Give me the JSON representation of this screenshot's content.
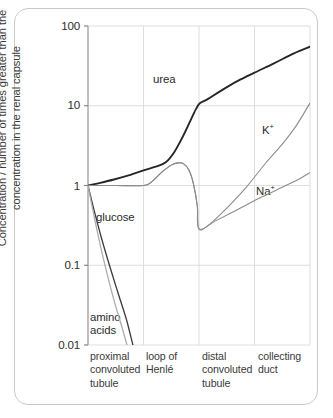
{
  "chart_data": {
    "type": "line",
    "title": "",
    "subtitle": "",
    "xlabel": "",
    "ylabel": "Concentration / number of times greater than the concentration in the renal capsule",
    "ylabel_line1": "Concentration / number of times greater than the",
    "ylabel_line2": "concentration in the renal capsule",
    "yscale": "log",
    "ylim": [
      0.01,
      100
    ],
    "ytick_labels": [
      "100",
      "10",
      "1",
      "0.1",
      "0.01"
    ],
    "ytick_values": [
      100,
      10,
      1,
      0.1,
      0.01
    ],
    "grid": true,
    "grid_axes": "both",
    "legend": "inline-annotations",
    "x_regions": [
      {
        "index": 0,
        "label_lines": [
          "proximal",
          "convoluted",
          "tubule"
        ],
        "x_start": 0,
        "x_end": 1
      },
      {
        "index": 1,
        "label_lines": [
          "loop of",
          "Henlé"
        ],
        "x_start": 1,
        "x_end": 2
      },
      {
        "index": 2,
        "label_lines": [
          "distal",
          "convoluted",
          "tubule"
        ],
        "x_start": 2,
        "x_end": 3
      },
      {
        "index": 3,
        "label_lines": [
          "collecting",
          "duct"
        ],
        "x_start": 3,
        "x_end": 4
      }
    ],
    "xlim": [
      0,
      4
    ],
    "series": [
      {
        "name": "urea",
        "label": "urea",
        "color": "#262626",
        "width": 1.9,
        "points": [
          [
            0.0,
            1.0
          ],
          [
            0.22,
            1.08
          ],
          [
            0.45,
            1.18
          ],
          [
            0.7,
            1.32
          ],
          [
            1.0,
            1.55
          ],
          [
            1.22,
            1.72
          ],
          [
            1.4,
            1.95
          ],
          [
            1.55,
            2.6
          ],
          [
            1.7,
            4.0
          ],
          [
            1.85,
            6.6
          ],
          [
            1.95,
            9.2
          ],
          [
            2.02,
            10.8
          ],
          [
            2.15,
            12.0
          ],
          [
            2.4,
            15.5
          ],
          [
            2.7,
            20.5
          ],
          [
            3.0,
            26.0
          ],
          [
            3.35,
            34.0
          ],
          [
            3.7,
            45.0
          ],
          [
            4.0,
            55.0
          ]
        ]
      },
      {
        "name": "potassium",
        "label": "K+",
        "label_html": "K<sup>+</sup>",
        "color": "#8c8c8c",
        "width": 1.1,
        "points": [
          [
            0.0,
            1.0
          ],
          [
            0.5,
            1.0
          ],
          [
            1.0,
            1.0
          ],
          [
            1.15,
            1.12
          ],
          [
            1.32,
            1.45
          ],
          [
            1.5,
            1.8
          ],
          [
            1.62,
            1.92
          ],
          [
            1.72,
            1.88
          ],
          [
            1.82,
            1.55
          ],
          [
            1.9,
            1.05
          ],
          [
            1.97,
            0.55
          ],
          [
            2.0,
            0.285
          ],
          [
            2.2,
            0.33
          ],
          [
            2.5,
            0.52
          ],
          [
            2.85,
            0.95
          ],
          [
            3.2,
            1.9
          ],
          [
            3.5,
            3.3
          ],
          [
            3.75,
            5.6
          ],
          [
            4.0,
            10.8
          ]
        ]
      },
      {
        "name": "sodium",
        "label": "Na+",
        "label_html": "Na<sup>+</sup>",
        "color": "#8c8c8c",
        "width": 1.1,
        "points": [
          [
            0.0,
            1.0
          ],
          [
            0.5,
            1.0
          ],
          [
            1.0,
            1.0
          ],
          [
            1.15,
            1.12
          ],
          [
            1.32,
            1.45
          ],
          [
            1.5,
            1.8
          ],
          [
            1.62,
            1.92
          ],
          [
            1.72,
            1.88
          ],
          [
            1.82,
            1.55
          ],
          [
            1.9,
            1.05
          ],
          [
            1.97,
            0.55
          ],
          [
            2.0,
            0.285
          ],
          [
            2.3,
            0.36
          ],
          [
            2.7,
            0.5
          ],
          [
            3.1,
            0.7
          ],
          [
            3.5,
            0.95
          ],
          [
            3.78,
            1.18
          ],
          [
            4.0,
            1.45
          ]
        ]
      },
      {
        "name": "glucose",
        "label": "glucose",
        "color": "#3a3a3a",
        "width": 1.3,
        "points": [
          [
            0.0,
            1.0
          ],
          [
            0.1,
            0.52
          ],
          [
            0.25,
            0.21
          ],
          [
            0.4,
            0.093
          ],
          [
            0.55,
            0.043
          ],
          [
            0.7,
            0.02
          ],
          [
            0.85,
            0.0098
          ],
          [
            0.92,
            0.007
          ]
        ]
      },
      {
        "name": "amino acids",
        "label": "amino acids",
        "label_lines": [
          "amino",
          "acids"
        ],
        "color": "#adadad",
        "width": 1.3,
        "points": [
          [
            0.0,
            1.0
          ],
          [
            0.09,
            0.48
          ],
          [
            0.22,
            0.18
          ],
          [
            0.35,
            0.075
          ],
          [
            0.48,
            0.034
          ],
          [
            0.62,
            0.016
          ],
          [
            0.75,
            0.009
          ],
          [
            0.84,
            0.006
          ]
        ]
      }
    ],
    "annotations": [
      {
        "name": "urea-label",
        "text": "urea",
        "x_px": 153,
        "y_px": 80
      },
      {
        "name": "potassium-label",
        "text": "K+",
        "x_px": 262,
        "y_px": 131
      },
      {
        "name": "sodium-label",
        "text": "Na+",
        "x_px": 258,
        "y_px": 192
      },
      {
        "name": "glucose-label",
        "text": "glucose",
        "x_px": 96,
        "y_px": 218
      },
      {
        "name": "amino-acids-label",
        "text": "amino acids",
        "x_px": 90,
        "y_px": 318
      }
    ],
    "colors": {
      "urea": "#262626",
      "ions": "#8c8c8c",
      "glucose": "#3a3a3a",
      "amino_acids": "#adadad",
      "grid": "#dedede",
      "axis": "#9a9a9a",
      "frame": "#c9c9c9",
      "text": "#333333",
      "background": "#ffffff"
    }
  }
}
